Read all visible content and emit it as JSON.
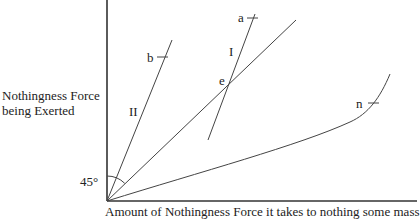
{
  "diagram": {
    "y_axis_label_line1": "Nothingness Force",
    "y_axis_label_line2": "being Exerted",
    "x_axis_label": "Amount of Nothingness Force it takes to nothing some mass",
    "angle_label": "45°",
    "line_labels": {
      "line_one": "I",
      "line_two": "II"
    },
    "point_labels": {
      "a": "a",
      "b": "b",
      "e": "e",
      "n": "n"
    }
  }
}
